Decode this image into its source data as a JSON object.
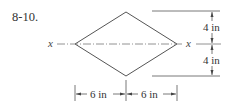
{
  "problem_number": "8-10.",
  "axis_label_left": "x",
  "axis_label_right": "x",
  "dimensions": {
    "upper_height": "4 in",
    "lower_height": "4 in",
    "left_width": "6 in",
    "right_width": "6 in"
  },
  "shape": "rhombus",
  "colors": {
    "line": "#555555",
    "text": "#333333"
  }
}
